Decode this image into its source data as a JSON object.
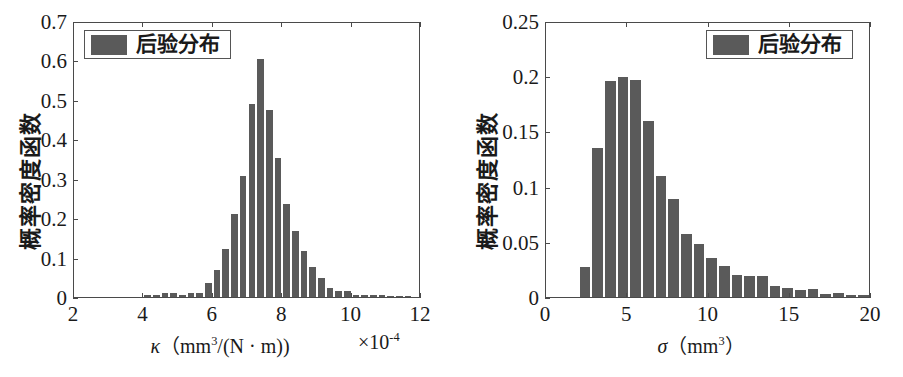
{
  "figure": {
    "background": "#ffffff",
    "bar_color": "#5a5a5a",
    "axis_color": "#4a4a4a"
  },
  "charts": [
    {
      "id": "kappa-posterior",
      "legend_label": "后验分布",
      "ylabel": "概率密度函数",
      "xlabel_main": "κ",
      "xlabel_units": "（mm3/(N · m))",
      "exponent_note": "×10-4",
      "xticks": [
        "2",
        "4",
        "6",
        "8",
        "10",
        "12"
      ],
      "yticks": [
        "0",
        "0.1",
        "0.2",
        "0.3",
        "0.4",
        "0.5",
        "0.6",
        "0.7"
      ]
    },
    {
      "id": "sigma-posterior",
      "legend_label": "后验分布",
      "ylabel": "概率密度函数",
      "xlabel_main": "σ",
      "xlabel_units": "（mm3）",
      "exponent_note": "",
      "xticks": [
        "0",
        "5",
        "10",
        "15",
        "20"
      ],
      "yticks": [
        "0",
        "0.05",
        "0.1",
        "0.15",
        "0.2",
        "0.25"
      ]
    }
  ],
  "chart_data": [
    {
      "type": "bar",
      "id": "kappa-posterior",
      "title": "",
      "xlabel": "κ（mm3/(N · m))  ×10-4",
      "ylabel": "概率密度函数",
      "legend": [
        "后验分布"
      ],
      "legend_position": "upper-left",
      "grid": false,
      "xlim": [
        2,
        12
      ],
      "ylim": [
        0,
        0.7
      ],
      "xticks": [
        2,
        4,
        6,
        8,
        10,
        12
      ],
      "yticks": [
        0,
        0.1,
        0.2,
        0.3,
        0.4,
        0.5,
        0.6,
        0.7
      ],
      "bin_width": 0.25,
      "bin_left_edges": [
        4.0,
        4.25,
        4.5,
        4.75,
        5.0,
        5.25,
        5.5,
        5.75,
        6.0,
        6.25,
        6.5,
        6.75,
        7.0,
        7.25,
        7.5,
        7.75,
        8.0,
        8.25,
        8.5,
        8.75,
        9.0,
        9.25,
        9.5,
        9.75,
        10.0,
        10.25,
        10.5,
        10.75,
        11.0,
        11.25,
        11.5
      ],
      "values": [
        0.004,
        0.004,
        0.009,
        0.009,
        0.006,
        0.009,
        0.01,
        0.035,
        0.068,
        0.122,
        0.211,
        0.306,
        0.49,
        0.603,
        0.475,
        0.353,
        0.235,
        0.167,
        0.116,
        0.077,
        0.048,
        0.023,
        0.015,
        0.016,
        0.006,
        0.006,
        0.005,
        0.004,
        0.003,
        0.002,
        0.002
      ]
    },
    {
      "type": "bar",
      "id": "sigma-posterior",
      "title": "",
      "xlabel": "σ（mm3）",
      "ylabel": "概率密度函数",
      "legend": [
        "后验分布"
      ],
      "legend_position": "upper-right",
      "grid": false,
      "xlim": [
        0,
        20
      ],
      "ylim": [
        0,
        0.25
      ],
      "xticks": [
        0,
        5,
        10,
        15,
        20
      ],
      "yticks": [
        0,
        0.05,
        0.1,
        0.15,
        0.2,
        0.25
      ],
      "bin_width": 0.78,
      "bin_left_edges": [
        2.0,
        2.78,
        3.56,
        4.34,
        5.12,
        5.9,
        6.68,
        7.46,
        8.24,
        9.02,
        9.8,
        10.58,
        11.36,
        12.14,
        12.92,
        13.7,
        14.48,
        15.26,
        16.04,
        16.82,
        17.6,
        18.38,
        19.16
      ],
      "values": [
        0.027,
        0.135,
        0.196,
        0.199,
        0.197,
        0.159,
        0.11,
        0.089,
        0.057,
        0.048,
        0.035,
        0.028,
        0.02,
        0.019,
        0.019,
        0.01,
        0.008,
        0.006,
        0.007,
        0.003,
        0.004,
        0.002,
        0.002
      ]
    }
  ]
}
